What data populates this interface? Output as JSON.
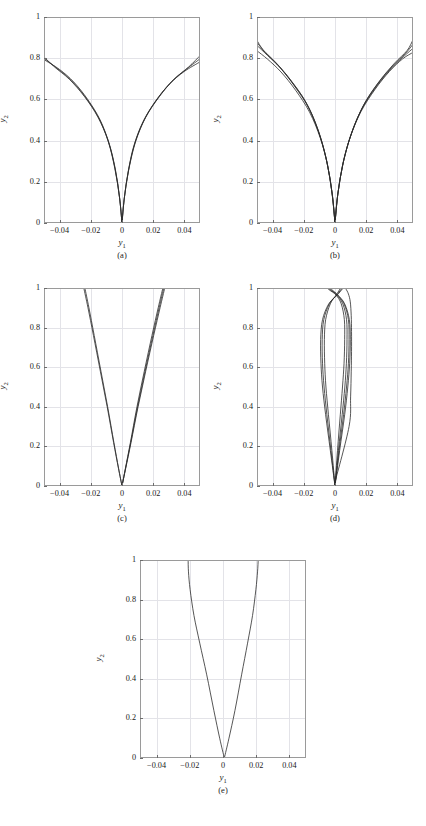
{
  "figure": {
    "axis_label_x": "y",
    "axis_label_x_sub": "1",
    "axis_label_y": "y",
    "axis_label_y_sub": "2",
    "captions": [
      "(a)",
      "(b)",
      "(c)",
      "(d)",
      "(e)"
    ],
    "line_color": "#2b2b2b",
    "grid_color": "#e3e3e8",
    "frame_color": "#9a9a9a"
  },
  "chart_data": [
    {
      "type": "line",
      "panel": "(a)",
      "title": "",
      "xlabel": "y1",
      "ylabel": "y2",
      "xlim": [
        -0.05,
        0.05
      ],
      "ylim": [
        0,
        1
      ],
      "xticks": [
        -0.04,
        -0.02,
        0,
        0.02,
        0.04
      ],
      "xticklabels": [
        "-0.04",
        "-0.02",
        "0",
        "0.02",
        "0.04"
      ],
      "yticks": [
        0,
        0.2,
        0.4,
        0.6,
        0.8,
        1
      ],
      "yticklabels": [
        "0",
        "0.2",
        "0.4",
        "0.6",
        "0.8",
        "1"
      ],
      "grid": true,
      "legend": "none",
      "description": "Bundle of V-shaped curves from origin flaring outward, tips reach y2 ~0.78-0.82 at x=+/-0.05",
      "series": [
        {
          "name": "c1",
          "x": [
            0.0,
            -0.0015,
            -0.004,
            -0.008,
            -0.014,
            -0.022,
            -0.031,
            -0.04,
            -0.05
          ],
          "y": [
            0.0,
            0.12,
            0.25,
            0.38,
            0.5,
            0.6,
            0.685,
            0.745,
            0.793
          ]
        },
        {
          "name": "c2",
          "x": [
            0.0,
            -0.0016,
            -0.0043,
            -0.0085,
            -0.0148,
            -0.0232,
            -0.0325,
            -0.0418,
            -0.05
          ],
          "y": [
            0.0,
            0.125,
            0.258,
            0.39,
            0.508,
            0.608,
            0.692,
            0.752,
            0.8
          ]
        },
        {
          "name": "c3",
          "x": [
            0.0,
            -0.0017,
            -0.0046,
            -0.009,
            -0.0155,
            -0.0242,
            -0.0338,
            -0.0432,
            -0.05
          ],
          "y": [
            0.0,
            0.13,
            0.265,
            0.4,
            0.515,
            0.615,
            0.698,
            0.757,
            0.806
          ]
        },
        {
          "name": "c4",
          "x": [
            0.0,
            0.0014,
            0.0038,
            0.0076,
            0.0135,
            0.0215,
            0.0305,
            0.0398,
            0.05
          ],
          "y": [
            0.0,
            0.115,
            0.243,
            0.375,
            0.492,
            0.592,
            0.675,
            0.735,
            0.782
          ]
        },
        {
          "name": "c5",
          "x": [
            0.0,
            0.0015,
            0.0041,
            0.0082,
            0.0144,
            0.0228,
            0.032,
            0.0415,
            0.05
          ],
          "y": [
            0.0,
            0.122,
            0.252,
            0.386,
            0.503,
            0.604,
            0.688,
            0.748,
            0.797
          ]
        },
        {
          "name": "c6",
          "x": [
            0.0,
            0.0016,
            0.0044,
            0.0088,
            0.0152,
            0.024,
            0.0334,
            0.0428,
            0.05
          ],
          "y": [
            0.0,
            0.128,
            0.262,
            0.397,
            0.513,
            0.614,
            0.698,
            0.758,
            0.812
          ]
        }
      ]
    },
    {
      "type": "line",
      "panel": "(b)",
      "title": "",
      "xlabel": "y1",
      "ylabel": "y2",
      "xlim": [
        -0.05,
        0.05
      ],
      "ylim": [
        0,
        1
      ],
      "xticks": [
        -0.04,
        -0.02,
        0,
        0.02,
        0.04
      ],
      "xticklabels": [
        "-0.04",
        "-0.02",
        "0",
        "0.02",
        "0.04"
      ],
      "yticks": [
        0,
        0.2,
        0.4,
        0.6,
        0.8,
        1
      ],
      "yticklabels": [
        "0",
        "0.2",
        "0.4",
        "0.6",
        "0.8",
        "1"
      ],
      "grid": true,
      "legend": "none",
      "description": "Wider fan of V-shaped curves, tips spread between y2 ~0.82 and ~0.90 at x=+/-0.05",
      "series": [
        {
          "name": "c1",
          "x": [
            0.0,
            -0.0018,
            -0.005,
            -0.01,
            -0.017,
            -0.026,
            -0.035,
            -0.0435,
            -0.05
          ],
          "y": [
            0.0,
            0.14,
            0.29,
            0.43,
            0.56,
            0.665,
            0.752,
            0.815,
            0.862
          ]
        },
        {
          "name": "c2",
          "x": [
            0.0,
            -0.0019,
            -0.0053,
            -0.0105,
            -0.0178,
            -0.0272,
            -0.0364,
            -0.0448,
            -0.05
          ],
          "y": [
            0.0,
            0.145,
            0.3,
            0.445,
            0.575,
            0.68,
            0.765,
            0.828,
            0.876
          ]
        },
        {
          "name": "c3",
          "x": [
            0.0,
            -0.002,
            -0.0056,
            -0.0112,
            -0.0188,
            -0.0285,
            -0.0378,
            -0.046,
            -0.05
          ],
          "y": [
            0.0,
            0.15,
            0.31,
            0.458,
            0.588,
            0.695,
            0.778,
            0.84,
            0.886
          ]
        },
        {
          "name": "c4",
          "x": [
            0.0,
            -0.0016,
            -0.0046,
            -0.0094,
            -0.0163,
            -0.0253,
            -0.0346,
            -0.0432,
            -0.05
          ],
          "y": [
            0.0,
            0.132,
            0.275,
            0.412,
            0.538,
            0.645,
            0.733,
            0.795,
            0.836
          ]
        },
        {
          "name": "c5",
          "x": [
            0.0,
            0.0017,
            0.0048,
            0.0097,
            0.0166,
            0.0256,
            0.0348,
            0.0434,
            0.05
          ],
          "y": [
            0.0,
            0.135,
            0.278,
            0.415,
            0.54,
            0.648,
            0.735,
            0.797,
            0.828
          ]
        },
        {
          "name": "c6",
          "x": [
            0.0,
            0.0018,
            0.0051,
            0.0102,
            0.0173,
            0.0265,
            0.0358,
            0.0443,
            0.05
          ],
          "y": [
            0.0,
            0.14,
            0.288,
            0.428,
            0.555,
            0.662,
            0.748,
            0.81,
            0.848
          ]
        },
        {
          "name": "c7",
          "x": [
            0.0,
            0.0019,
            0.0054,
            0.0108,
            0.0182,
            0.0276,
            0.037,
            0.0453,
            0.05
          ],
          "y": [
            0.0,
            0.145,
            0.298,
            0.44,
            0.57,
            0.678,
            0.762,
            0.824,
            0.868
          ]
        },
        {
          "name": "c8",
          "x": [
            0.0,
            0.002,
            0.0057,
            0.0114,
            0.0191,
            0.0288,
            0.0382,
            0.0463,
            0.05
          ],
          "y": [
            0.0,
            0.15,
            0.308,
            0.453,
            0.583,
            0.692,
            0.776,
            0.838,
            0.89
          ]
        }
      ]
    },
    {
      "type": "line",
      "panel": "(c)",
      "title": "",
      "xlabel": "y1",
      "ylabel": "y2",
      "xlim": [
        -0.05,
        0.05
      ],
      "ylim": [
        0,
        1
      ],
      "xticks": [
        -0.04,
        -0.02,
        0,
        0.02,
        0.04
      ],
      "xticklabels": [
        "-0.04",
        "-0.02",
        "0",
        "0.02",
        "0.04"
      ],
      "yticks": [
        0,
        0.2,
        0.4,
        0.6,
        0.8,
        1
      ],
      "yticklabels": [
        "0",
        "0.2",
        "0.4",
        "0.6",
        "0.8",
        "1"
      ],
      "grid": true,
      "legend": "none",
      "description": "Narrow near-straight V reaching top boundary y2=1 at about x=-0.024 and x=+0.026",
      "series": [
        {
          "name": "c1",
          "x": [
            0.0,
            -0.0022,
            -0.0052,
            -0.0092,
            -0.0135,
            -0.0178,
            -0.0212,
            -0.0238
          ],
          "y": [
            0.0,
            0.09,
            0.22,
            0.4,
            0.58,
            0.76,
            0.9,
            1.0
          ]
        },
        {
          "name": "c2",
          "x": [
            0.0,
            -0.0023,
            -0.0054,
            -0.0095,
            -0.0139,
            -0.0183,
            -0.0218,
            -0.0245
          ],
          "y": [
            0.0,
            0.09,
            0.22,
            0.4,
            0.58,
            0.76,
            0.9,
            1.0
          ]
        },
        {
          "name": "c3",
          "x": [
            0.0,
            0.0022,
            0.0054,
            0.0096,
            0.0143,
            0.0192,
            0.0232,
            0.0262
          ],
          "y": [
            0.0,
            0.09,
            0.22,
            0.4,
            0.58,
            0.76,
            0.9,
            1.0
          ]
        },
        {
          "name": "c4",
          "x": [
            0.0,
            0.0023,
            0.0056,
            0.01,
            0.0148,
            0.0198,
            0.0238,
            0.0268
          ],
          "y": [
            0.0,
            0.09,
            0.22,
            0.4,
            0.58,
            0.76,
            0.9,
            1.0
          ]
        },
        {
          "name": "c5",
          "x": [
            0.0,
            0.0024,
            0.0058,
            0.0103,
            0.0152,
            0.0203,
            0.0244,
            0.0274
          ],
          "y": [
            0.0,
            0.09,
            0.22,
            0.4,
            0.58,
            0.76,
            0.9,
            1.0
          ]
        }
      ]
    },
    {
      "type": "line",
      "panel": "(d)",
      "title": "",
      "xlabel": "y1",
      "ylabel": "y2",
      "xlim": [
        -0.05,
        0.05
      ],
      "ylim": [
        0,
        1
      ],
      "xticks": [
        -0.04,
        -0.02,
        0,
        0.02,
        0.04
      ],
      "xticklabels": [
        "-0.04",
        "-0.02",
        "0",
        "0.02",
        "0.04"
      ],
      "yticks": [
        0,
        0.2,
        0.4,
        0.6,
        0.8,
        1
      ],
      "yticklabels": [
        "0",
        "0.2",
        "0.4",
        "0.6",
        "0.8",
        "1"
      ],
      "grid": true,
      "legend": "none",
      "description": "Very narrow bundle of curves rising from origin, bulging to about +/-0.010 near y2=0.6-0.8, converging and crossing near y2=0.93, then flaring out at the top edge",
      "series": [
        {
          "name": "c1",
          "x": [
            0.0,
            -0.003,
            -0.006,
            -0.008,
            -0.009,
            -0.0092,
            -0.008,
            -0.004,
            0.0015,
            0.0042,
            0.0052
          ],
          "y": [
            0.0,
            0.18,
            0.36,
            0.5,
            0.62,
            0.74,
            0.84,
            0.92,
            0.965,
            0.99,
            1.0
          ]
        },
        {
          "name": "c2",
          "x": [
            0.0,
            -0.0026,
            -0.0052,
            -0.007,
            -0.008,
            -0.0082,
            -0.0072,
            -0.0036,
            0.0012,
            0.0036,
            0.0046
          ],
          "y": [
            0.0,
            0.18,
            0.36,
            0.5,
            0.62,
            0.74,
            0.84,
            0.92,
            0.965,
            0.99,
            1.0
          ]
        },
        {
          "name": "c3",
          "x": [
            0.0,
            -0.002,
            -0.0042,
            -0.0058,
            -0.0066,
            -0.0068,
            -0.006,
            -0.003,
            0.0008,
            0.0028,
            0.0036
          ],
          "y": [
            0.0,
            0.18,
            0.36,
            0.5,
            0.62,
            0.74,
            0.84,
            0.92,
            0.965,
            0.99,
            1.0
          ]
        },
        {
          "name": "c4",
          "x": [
            0.0,
            0.003,
            0.0062,
            0.0082,
            0.0094,
            0.0098,
            0.0092,
            0.0062,
            0.0018,
            -0.0018,
            -0.003
          ],
          "y": [
            0.0,
            0.18,
            0.36,
            0.5,
            0.62,
            0.74,
            0.84,
            0.92,
            0.965,
            0.99,
            1.0
          ]
        },
        {
          "name": "c5",
          "x": [
            0.0,
            0.0026,
            0.0055,
            0.0074,
            0.0086,
            0.009,
            0.0086,
            0.0058,
            0.0014,
            -0.0024,
            -0.0038
          ],
          "y": [
            0.0,
            0.18,
            0.36,
            0.5,
            0.62,
            0.74,
            0.84,
            0.92,
            0.965,
            0.99,
            1.0
          ]
        },
        {
          "name": "c6",
          "x": [
            0.0,
            0.0022,
            0.0046,
            0.0063,
            0.0073,
            0.0077,
            0.0074,
            0.005,
            0.001,
            -0.003,
            -0.0044
          ],
          "y": [
            0.0,
            0.18,
            0.36,
            0.5,
            0.62,
            0.74,
            0.84,
            0.92,
            0.965,
            0.99,
            1.0
          ]
        },
        {
          "name": "c7",
          "x": [
            0.0,
            0.0016,
            0.0034,
            0.0048,
            0.0058,
            0.0062,
            0.006,
            0.004,
            0.0006,
            -0.0036,
            -0.005
          ],
          "y": [
            0.0,
            0.18,
            0.36,
            0.5,
            0.62,
            0.74,
            0.84,
            0.92,
            0.965,
            0.99,
            1.0
          ]
        },
        {
          "name": "c8",
          "x": [
            0.0,
            0.009,
            0.01,
            0.0104,
            0.0106,
            0.0106,
            0.0104,
            0.0098,
            0.0086,
            0.007,
            0.0062
          ],
          "y": [
            0.02,
            0.3,
            0.45,
            0.58,
            0.68,
            0.78,
            0.86,
            0.93,
            0.97,
            0.995,
            1.0
          ]
        }
      ]
    },
    {
      "type": "line",
      "panel": "(e)",
      "title": "",
      "xlabel": "y1",
      "ylabel": "y2",
      "xlim": [
        -0.05,
        0.05
      ],
      "ylim": [
        0,
        1
      ],
      "xticks": [
        -0.04,
        -0.02,
        0,
        0.02,
        0.04
      ],
      "xticklabels": [
        "-0.04",
        "-0.02",
        "0",
        "0.02",
        "0.04"
      ],
      "yticks": [
        0,
        0.2,
        0.4,
        0.6,
        0.8,
        1
      ],
      "yticklabels": [
        "0",
        "0.2",
        "0.4",
        "0.6",
        "0.8",
        "1"
      ],
      "grid": true,
      "legend": "none",
      "description": "Single pair of curves forming a V from origin reaching top edge at about x=-0.021 and x=+0.021",
      "series": [
        {
          "name": "left",
          "x": [
            0.0008,
            -0.002,
            -0.0055,
            -0.0098,
            -0.014,
            -0.0175,
            -0.0198,
            -0.0208,
            -0.021
          ],
          "y": [
            0.0,
            0.1,
            0.24,
            0.42,
            0.58,
            0.72,
            0.85,
            0.94,
            1.0
          ]
        },
        {
          "name": "right",
          "x": [
            0.0008,
            0.0036,
            0.0072,
            0.0112,
            0.0148,
            0.0178,
            0.0198,
            0.0208,
            0.0212
          ],
          "y": [
            0.0,
            0.1,
            0.24,
            0.42,
            0.58,
            0.72,
            0.85,
            0.94,
            1.0
          ]
        }
      ]
    }
  ]
}
